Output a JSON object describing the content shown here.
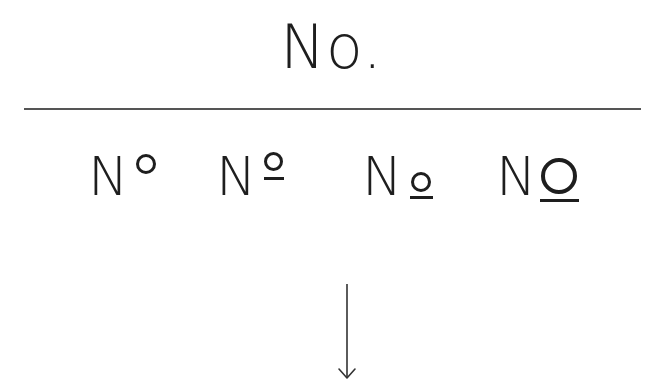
{
  "title": "No.",
  "variants": [
    {
      "id": "numero-degree",
      "base": "N",
      "description": "N with superscript o (degree style)"
    },
    {
      "id": "numero-ordinal",
      "base": "N",
      "description": "N with underlined superscript o (ordinal indicator)"
    },
    {
      "id": "numero-small-underlined",
      "base": "N",
      "description": "N with small underlined o at baseline"
    },
    {
      "id": "numero-large-underlined",
      "base": "N",
      "description": "N with large underlined O"
    }
  ],
  "arrow": {
    "direction": "down",
    "icon": "arrow-down-icon"
  },
  "colors": {
    "text": "#1e1e1e",
    "divider": "#555555",
    "background": "#ffffff"
  }
}
